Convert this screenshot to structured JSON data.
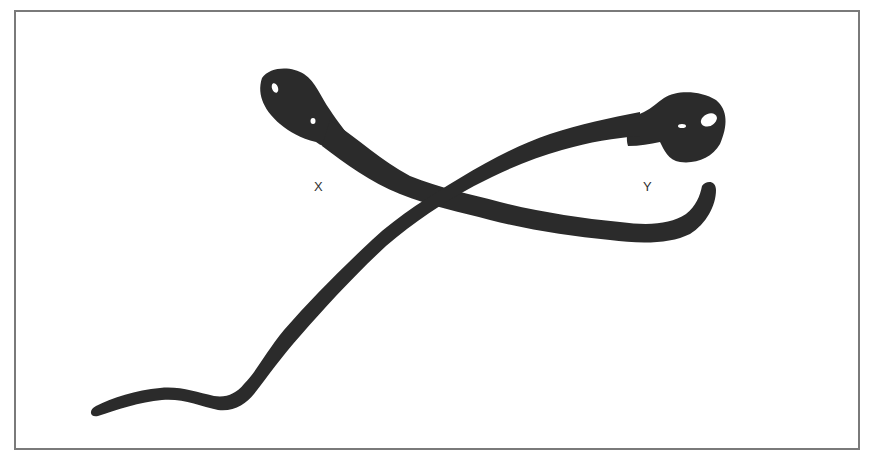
{
  "figure": {
    "labels": {
      "x": "X",
      "y": "Y"
    },
    "colors": {
      "shape_fill": "#2b2b2b",
      "border": "#7a7a7a",
      "background": "#ffffff",
      "label_text": "#333333"
    },
    "elements": [
      {
        "name": "shape-x",
        "description": "head at upper left, tail crossing to lower right curling up at right end"
      },
      {
        "name": "shape-y",
        "description": "head at upper right, tail crossing down to lower left with wavy end"
      }
    ]
  }
}
